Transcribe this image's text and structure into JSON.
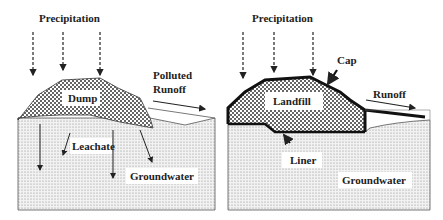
{
  "panels": [
    {
      "id": "dump",
      "labels": {
        "precipitation": "Precipitation",
        "waste": "Dump",
        "runoff_line1": "Polluted",
        "runoff_line2": "Runoff",
        "leachate": "Leachate",
        "groundwater": "Groundwater"
      }
    },
    {
      "id": "landfill",
      "labels": {
        "precipitation": "Precipitation",
        "waste": "Landfill",
        "cap": "Cap",
        "runoff": "Runoff",
        "liner": "Liner",
        "groundwater": "Groundwater"
      }
    }
  ],
  "colors": {
    "line": "#222222",
    "ground_dot": "#8a8a8a",
    "waste_dot": "#333333",
    "background": "#ffffff"
  }
}
